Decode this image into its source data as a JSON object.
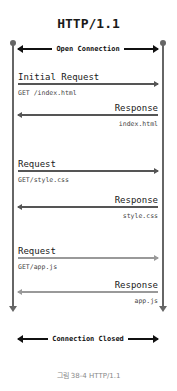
{
  "diagram": {
    "title": "HTTP/1.1",
    "open_banner": "Open Connection",
    "close_banner": "Connection Closed",
    "messages": [
      {
        "type": "request",
        "label": "Initial Request",
        "detail": "GET /index.html"
      },
      {
        "type": "response",
        "label": "Response",
        "detail": "index.html"
      },
      {
        "type": "request",
        "label": "Request",
        "detail": "GET/style.css"
      },
      {
        "type": "response",
        "label": "Response",
        "detail": "style.css"
      },
      {
        "type": "request",
        "label": "Request",
        "detail": "GET/app.js"
      },
      {
        "type": "response",
        "label": "Response",
        "detail": "app.js"
      }
    ],
    "caption": "그림 38-4 HTTP/1.1"
  },
  "colors": {
    "lifeline": "#666666",
    "arrow_dark": "#555555",
    "arrow_light": "#999999",
    "caption": "#888888"
  }
}
